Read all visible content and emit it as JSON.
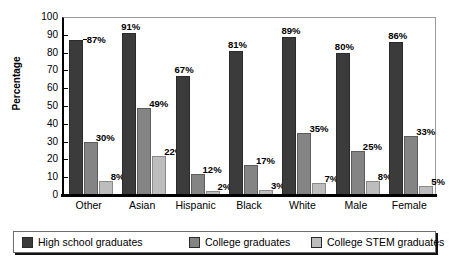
{
  "chart_data": {
    "type": "bar",
    "title": "",
    "xlabel": "",
    "ylabel": "Percentage",
    "ylim": [
      0,
      100
    ],
    "ytick_step": 10,
    "yticks": [
      100,
      90,
      80,
      70,
      60,
      50,
      40,
      30,
      20,
      10,
      0
    ],
    "grid": false,
    "legend_position": "bottom",
    "categories": [
      "Other",
      "Asian",
      "Hispanic",
      "Black",
      "White",
      "Male",
      "Female"
    ],
    "series": [
      {
        "name": "High school graduates",
        "color": "#3b3b3b",
        "values": [
          87,
          91,
          67,
          81,
          89,
          80,
          86
        ],
        "labels": [
          "87%",
          "91%",
          "67%",
          "81%",
          "89%",
          "80%",
          "86%"
        ]
      },
      {
        "name": "College graduates",
        "color": "#848484",
        "values": [
          30,
          49,
          12,
          17,
          35,
          25,
          33
        ],
        "labels": [
          "30%",
          "49%",
          "12%",
          "17%",
          "35%",
          "25%",
          "33%"
        ]
      },
      {
        "name": "College STEM graduates",
        "color": "#bdbdbd",
        "values": [
          8,
          22,
          2,
          3,
          7,
          8,
          5
        ],
        "labels": [
          "8%",
          "22%",
          "2%",
          "3%",
          "7%",
          "8%",
          "5%"
        ]
      }
    ]
  },
  "legend": {
    "items": [
      {
        "label": "High school graduates",
        "color": "#3b3b3b"
      },
      {
        "label": "College graduates",
        "color": "#848484"
      },
      {
        "label": "College STEM graduates",
        "color": "#bdbdbd"
      }
    ]
  }
}
